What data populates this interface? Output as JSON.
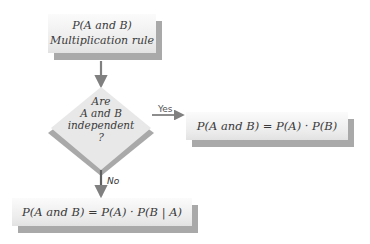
{
  "diagram": {
    "title_node": {
      "line1": "P(A and B)",
      "line2": "Multiplication rule"
    },
    "decision_node": {
      "line1": "Are",
      "line2": "A and B",
      "line3": "independent",
      "line4": "?"
    },
    "yes_branch": {
      "label": "Yes",
      "formula": "P(A and B) = P(A) · P(B)"
    },
    "no_branch": {
      "label": "No",
      "formula": "P(A and B) = P(A) · P(B | A)"
    },
    "colors": {
      "box_fill": "#eeeeee",
      "shadow": "#a9a9a9",
      "arrow": "#808080",
      "diamond_fill": "#e6e6e6",
      "diamond_shadow": "#a9a9a9"
    }
  }
}
